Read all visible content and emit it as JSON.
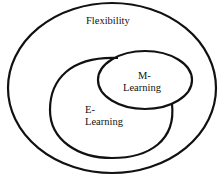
{
  "diagram": {
    "outer": {
      "label": "Flexibility"
    },
    "e_learning": {
      "line1": "E-",
      "line2": "Learning"
    },
    "m_learning": {
      "line1": "M-",
      "line2": "Learning"
    }
  }
}
